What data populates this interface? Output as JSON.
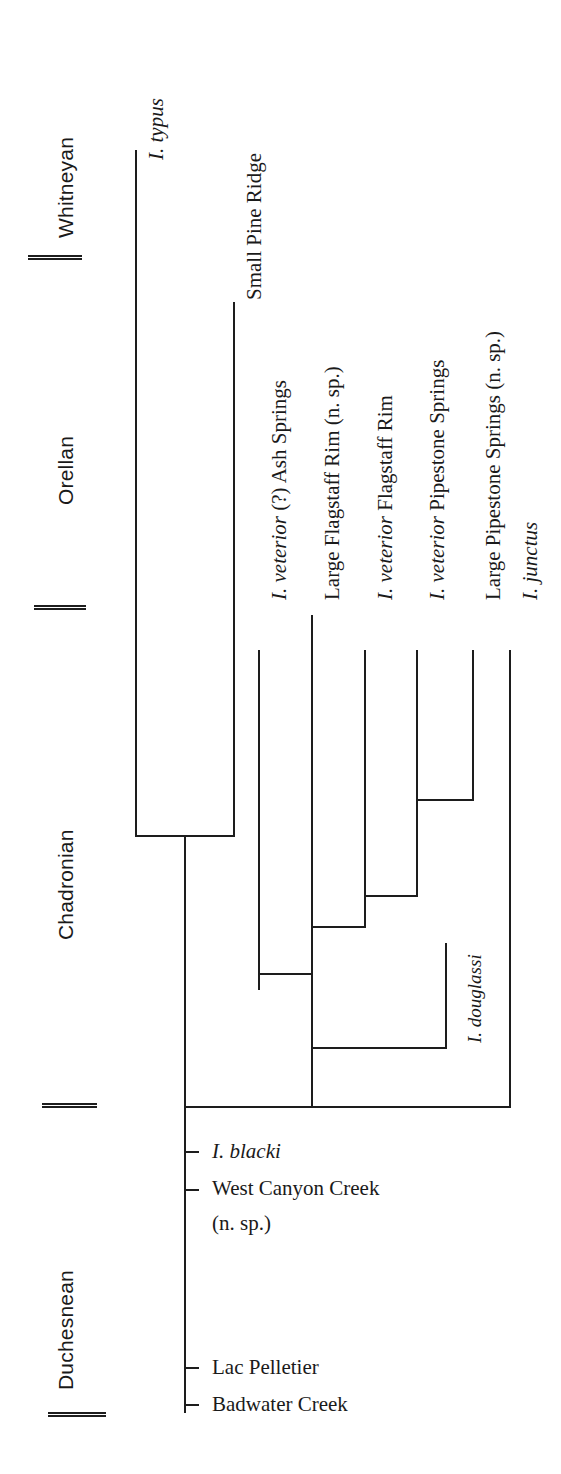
{
  "figure": {
    "type": "phylogenetic-tree",
    "orientation": "vertical-time-down",
    "title": ""
  },
  "timescale": {
    "name": "North American Land Mammal Ages",
    "ages": [
      {
        "label": "Whitneyan",
        "top": 40,
        "bottom": 258
      },
      {
        "label": "Orellan",
        "top": 258,
        "bottom": 608
      },
      {
        "label": "Chadronian",
        "top": 608,
        "bottom": 1106
      },
      {
        "label": "Duchesnean",
        "top": 1106,
        "bottom": 1416
      }
    ],
    "boundaries": [
      {
        "name": "whitneyan-orellan",
        "y": 255
      },
      {
        "name": "orellan-chadronian",
        "y": 605
      },
      {
        "name": "chadronian-duchesnean",
        "y": 1103
      },
      {
        "name": "duchesnean-base",
        "y": 1412
      }
    ]
  },
  "taxa": [
    {
      "id": "i-typus",
      "genus": "I. typus",
      "italic": true,
      "locality": "",
      "suffix": ""
    },
    {
      "id": "small-pine-ridge",
      "genus": "",
      "italic": false,
      "locality": "Small Pine Ridge",
      "suffix": ""
    },
    {
      "id": "ash-springs",
      "genus": "I. veterior",
      "italic": true,
      "locality": "(?) Ash Springs",
      "suffix": ""
    },
    {
      "id": "large-flagstaff-rim",
      "genus": "",
      "italic": false,
      "locality": "Large Flagstaff Rim",
      "suffix": "(n. sp.)"
    },
    {
      "id": "flagstaff-rim",
      "genus": "I. veterior",
      "italic": true,
      "locality": "Flagstaff Rim",
      "suffix": ""
    },
    {
      "id": "pipestone-springs",
      "genus": "I. veterior",
      "italic": true,
      "locality": "Pipestone Springs",
      "suffix": ""
    },
    {
      "id": "large-pipestone",
      "genus": "",
      "italic": false,
      "locality": "Large Pipestone Springs",
      "suffix": "(n. sp.)"
    },
    {
      "id": "i-junctus",
      "genus": "I. junctus",
      "italic": true,
      "locality": "",
      "suffix": ""
    },
    {
      "id": "i-douglassi",
      "genus": "I. douglassi",
      "italic": true,
      "locality": "",
      "suffix": ""
    }
  ],
  "labels": {
    "i_typus": "I. typus",
    "small_pine_ridge": "Small Pine Ridge",
    "ash_springs_genus": "I. veterior",
    "ash_springs_rest": " (?) Ash Springs",
    "large_flagstaff": "Large Flagstaff Rim (n. sp.)",
    "flagstaff_genus": "I. veterior",
    "flagstaff_rest": " Flagstaff Rim",
    "pipestone_genus": "I. veterior",
    "pipestone_rest": " Pipestone Springs",
    "large_pipestone": "Large Pipestone Springs (n. sp.)",
    "i_junctus": "I. junctus",
    "i_douglassi": "I. douglassi",
    "i_blacki": "I. blacki",
    "west_canyon_creek": "West Canyon Creek",
    "west_canyon_creek_sp": "(n. sp.)",
    "lac_pelletier": "Lac Pelletier",
    "badwater_creek": "Badwater Creek"
  },
  "occurrences": [
    {
      "label": "I. blacki",
      "italic": true,
      "y": 1151
    },
    {
      "label": "West Canyon Creek",
      "italic": false,
      "y": 1187
    },
    {
      "label": "Lac Pelletier",
      "italic": false,
      "y": 1367
    },
    {
      "label": "Badwater Creek",
      "italic": false,
      "y": 1403
    }
  ],
  "colors": {
    "ink": "#1d1d1d",
    "background": "#ffffff"
  },
  "branches": {
    "root_x": 185,
    "base_y": 1106,
    "node_typus_small_pine": 835,
    "node_right_clade": 1106
  }
}
